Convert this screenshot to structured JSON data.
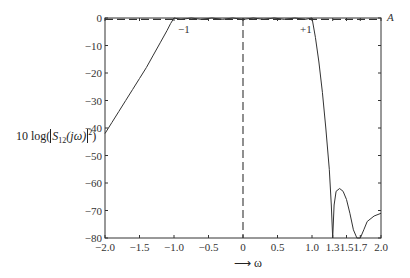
{
  "chart_data": {
    "type": "line",
    "title": "",
    "xlabel": "→ ω",
    "ylabel": "10 log(|S12(jω)|²)",
    "xlim": [
      -2.0,
      2.0
    ],
    "ylim": [
      -80,
      0
    ],
    "grid": false,
    "x_ticks": [
      -2.0,
      -1.5,
      -1.0,
      -0.5,
      0,
      0.5,
      1.0,
      1.3,
      1.5,
      1.7,
      2.0
    ],
    "x_tick_labels": [
      "-2.0",
      "-1.5",
      "-1.0",
      "-0.5",
      "0",
      "0.5",
      "1.0",
      "1.3",
      "1.5",
      "1.7",
      "2.0"
    ],
    "y_ticks": [
      0,
      -10,
      -20,
      -30,
      -40,
      -50,
      -60,
      -70,
      -80
    ],
    "y_tick_labels": [
      "0",
      "-10",
      "-20",
      "-30",
      "-40",
      "-50",
      "-60",
      "-70",
      "-80"
    ],
    "annotations": [
      {
        "text": "-1",
        "x": -1.0,
        "y": -3
      },
      {
        "text": "+1",
        "x": 1.0,
        "y": -3
      },
      {
        "text": "A",
        "x": 2.0,
        "y": 0
      }
    ],
    "series": [
      {
        "name": "S12 response",
        "style": "solid",
        "x": [
          -2.0,
          -1.9,
          -1.8,
          -1.7,
          -1.6,
          -1.5,
          -1.4,
          -1.3,
          -1.2,
          -1.1,
          -1.05,
          -1.0,
          -0.9,
          -0.75,
          -0.6,
          -0.45,
          -0.3,
          -0.15,
          0.0,
          0.15,
          0.3,
          0.45,
          0.6,
          0.75,
          0.9,
          1.0,
          1.05,
          1.1,
          1.15,
          1.2,
          1.25,
          1.28,
          1.3,
          1.32,
          1.35,
          1.4,
          1.45,
          1.5,
          1.55,
          1.6,
          1.65,
          1.7,
          1.75,
          1.8,
          1.9,
          2.0
        ],
        "y": [
          -42,
          -38,
          -34,
          -30,
          -26,
          -22,
          -18,
          -13.5,
          -9,
          -4.5,
          -2,
          0,
          -0.5,
          0,
          -0.5,
          0,
          -0.5,
          0,
          -0.5,
          0,
          -0.5,
          0,
          -0.5,
          0,
          -0.5,
          0,
          -7,
          -16,
          -27,
          -40,
          -55,
          -68,
          -80,
          -68,
          -63,
          -62,
          -63,
          -66,
          -71,
          -77,
          -80,
          -80,
          -77,
          -74,
          -72,
          -71
        ]
      },
      {
        "name": "ripple level A",
        "style": "dashed",
        "x": [
          -2.0,
          2.0
        ],
        "y": [
          -0.5,
          -0.5
        ]
      },
      {
        "name": "ω = 0 marker",
        "style": "dashed",
        "x": [
          0,
          0
        ],
        "y": [
          0,
          -80
        ]
      }
    ]
  },
  "labels": {
    "ylabel_main": "10 log(",
    "ylabel_s": "S",
    "ylabel_sub": "12",
    "ylabel_arg": "(jω)",
    "ylabel_sup": "2",
    "ylabel_close": ")",
    "xlabel": "⟶ ω",
    "anno_minus1": "−1",
    "anno_plus1": "+1",
    "anno_A": "A"
  }
}
